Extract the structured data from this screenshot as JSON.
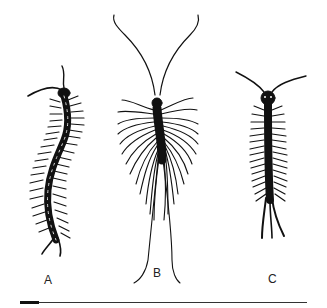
{
  "figure": {
    "type": "scientific illustration",
    "specimens": [
      {
        "label": "A",
        "description": "elongated curved centipede, dorsal view"
      },
      {
        "label": "B",
        "description": "house centipede with long legs and antennae, dorsal view"
      },
      {
        "label": "C",
        "description": "straight-bodied centipede, dorsal view"
      }
    ],
    "scale_bar": {
      "visible": true
    }
  },
  "colors": {
    "ink": "#111111",
    "background": "#ffffff"
  }
}
